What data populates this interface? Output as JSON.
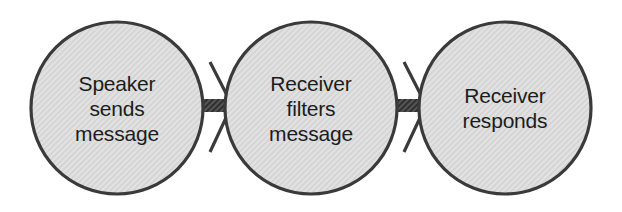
{
  "diagram": {
    "type": "flow-chain",
    "canvas": {
      "width": 622,
      "height": 212,
      "background": "#ffffff"
    },
    "style": {
      "node_fill": "#dcdcdc",
      "node_hatch": "#c9c9c9",
      "node_stroke": "#3a3a3a",
      "node_stroke_width": 3.2,
      "connector_fill": "#4a4a4a",
      "connector_hatch": "#2c2c2c",
      "arrowhead_stroke": "#3a3a3a",
      "text_color": "#1c1c1c"
    },
    "nodes": [
      {
        "id": "speaker-sends-message",
        "label": "Speaker\nsends\nmessage",
        "lines": [
          "Speaker",
          "sends",
          "message"
        ],
        "cx": 117,
        "cy": 108,
        "rx": 86,
        "ry": 86
      },
      {
        "id": "receiver-filters-message",
        "label": "Receiver\nfilters\nmessage",
        "lines": [
          "Receiver",
          "filters",
          "message"
        ],
        "cx": 311,
        "cy": 108,
        "rx": 86,
        "ry": 86
      },
      {
        "id": "receiver-responds",
        "label": "Receiver\nresponds",
        "lines": [
          "Receiver",
          "responds"
        ],
        "cx": 505,
        "cy": 108,
        "rx": 86,
        "ry": 86
      }
    ],
    "connectors": [
      {
        "id": "connector-speaker-to-receiver",
        "from": "speaker-sends-message",
        "to": "receiver-filters-message",
        "bar": {
          "x": 199,
          "y": 99,
          "width": 31,
          "height": 13
        },
        "arrowhead": {
          "tip_x": 232,
          "tip_y": 105,
          "upper_x": 210,
          "upper_y": 62,
          "lower_x": 210,
          "lower_y": 152,
          "stroke_width": 3.2
        }
      },
      {
        "id": "connector-receiver-to-responds",
        "from": "receiver-filters-message",
        "to": "receiver-responds",
        "bar": {
          "x": 393,
          "y": 99,
          "width": 31,
          "height": 13
        },
        "arrowhead": {
          "tip_x": 426,
          "tip_y": 105,
          "upper_x": 404,
          "upper_y": 62,
          "lower_x": 404,
          "lower_y": 152,
          "stroke_width": 3.2
        }
      }
    ]
  }
}
